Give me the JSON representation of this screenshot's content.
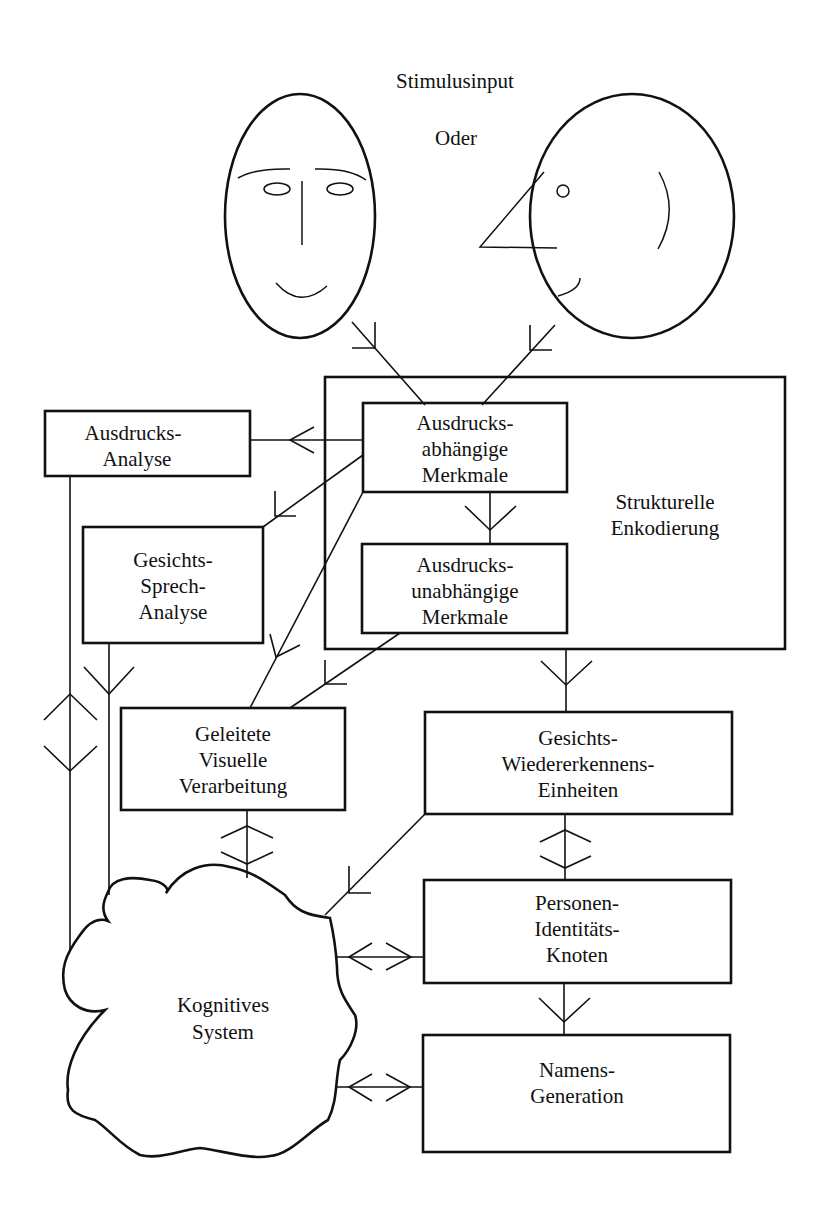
{
  "title": "Stimulusinput",
  "or_label": "Oder",
  "faces": {
    "frontal": "frontal-face",
    "profile": "profile-face"
  },
  "boxes": {
    "structural_encoding": {
      "line1": "Strukturelle",
      "line2": "Enkodierung"
    },
    "expression_dependent": {
      "line1": "Ausdrucks-",
      "line2": "abhängige",
      "line3": "Merkmale"
    },
    "expression_independent": {
      "line1": "Ausdrucks-",
      "line2": "unabhängige",
      "line3": "Merkmale"
    },
    "expression_analysis": {
      "line1": "Ausdrucks-",
      "line2": "Analyse"
    },
    "facial_speech_analysis": {
      "line1": "Gesichts-",
      "line2": "Sprech-",
      "line3": "Analyse"
    },
    "directed_visual_processing": {
      "line1": "Geleitete",
      "line2": "Visuelle",
      "line3": "Verarbeitung"
    },
    "face_recognition_units": {
      "line1": "Gesichts-",
      "line2": "Wiedererkennens-",
      "line3": "Einheiten"
    },
    "person_identity_nodes": {
      "line1": "Personen-",
      "line2": "Identitäts-",
      "line3": "Knoten"
    },
    "name_generation": {
      "line1": "Namens-",
      "line2": "Generation"
    },
    "cognitive_system": {
      "line1": "Kognitives",
      "line2": "System"
    }
  }
}
